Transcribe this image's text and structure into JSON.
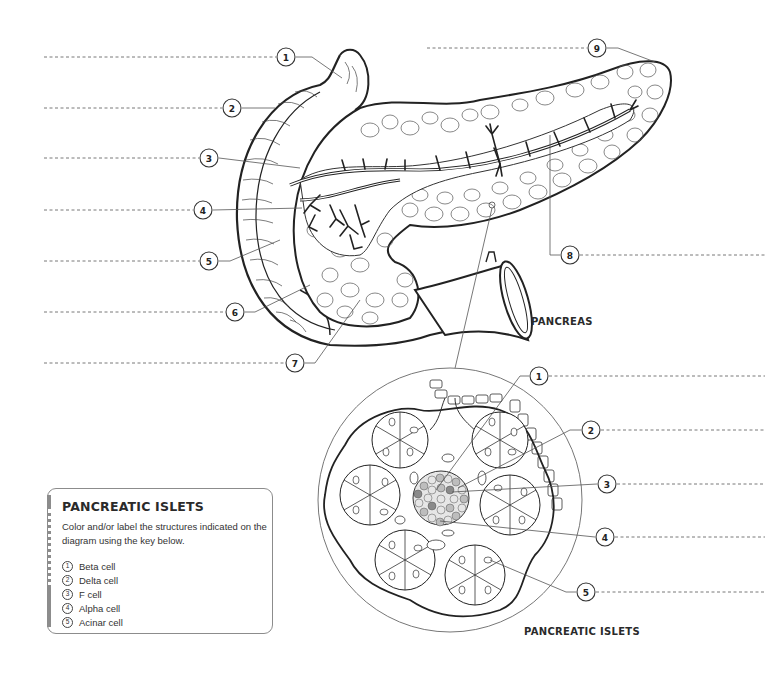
{
  "pancreas_section": {
    "title": "PANCREAS",
    "callouts": [
      {
        "num": "1",
        "cx": 286,
        "cy": 57
      },
      {
        "num": "2",
        "cx": 232,
        "cy": 108
      },
      {
        "num": "3",
        "cx": 209,
        "cy": 158
      },
      {
        "num": "4",
        "cx": 203,
        "cy": 210
      },
      {
        "num": "5",
        "cx": 209,
        "cy": 261
      },
      {
        "num": "6",
        "cx": 235,
        "cy": 312
      },
      {
        "num": "7",
        "cx": 295,
        "cy": 363
      },
      {
        "num": "8",
        "cx": 570,
        "cy": 255
      },
      {
        "num": "9",
        "cx": 597,
        "cy": 48
      }
    ]
  },
  "islets_section": {
    "title": "PANCREATIC ISLETS",
    "callouts": [
      {
        "num": "1",
        "cx": 539,
        "cy": 376
      },
      {
        "num": "2",
        "cx": 591,
        "cy": 430
      },
      {
        "num": "3",
        "cx": 607,
        "cy": 484
      },
      {
        "num": "4",
        "cx": 605,
        "cy": 537
      },
      {
        "num": "5",
        "cx": 586,
        "cy": 592
      }
    ]
  },
  "key": {
    "title": "PANCREATIC ISLETS",
    "description": "Color and/or label the structures indicated on the diagram using the key below.",
    "items": [
      {
        "num": "1",
        "label": "Beta cell"
      },
      {
        "num": "2",
        "label": "Delta cell"
      },
      {
        "num": "3",
        "label": "F cell"
      },
      {
        "num": "4",
        "label": "Alpha cell"
      },
      {
        "num": "5",
        "label": "Acinar cell"
      }
    ]
  },
  "colors": {
    "line": "#222222",
    "dashed_guide": "#555555",
    "key_border": "#8c8c8c",
    "islet_dark": "#8a8a8a",
    "islet_mid": "#bdbdbd"
  }
}
